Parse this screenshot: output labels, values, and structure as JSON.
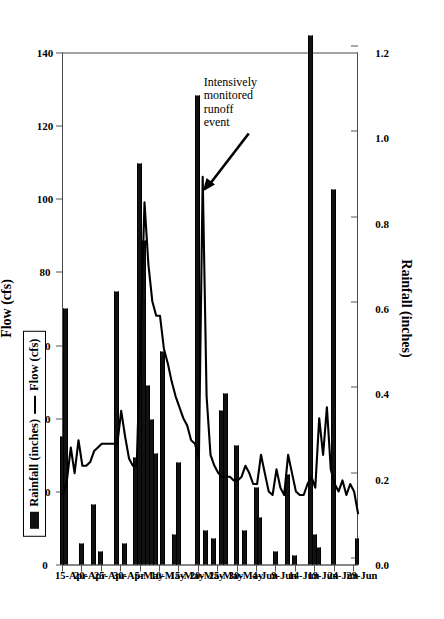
{
  "chart_data": {
    "type": "line",
    "title": "",
    "xlabel": "Date",
    "ylabel": "Rainfall (inches)",
    "y2label": "Flow (cfs)",
    "grid": false,
    "legend_position": "left-middle",
    "rain_axis": {
      "label": "Rainfall (inches)",
      "ticks": [
        "1.2",
        "1.0",
        "0.8",
        "0.6",
        "0.4",
        "0.2",
        "0.0"
      ],
      "tick_values": [
        1.2,
        1.0,
        0.8,
        0.6,
        0.4,
        0.2,
        0.0
      ],
      "lim": [
        0.0,
        1.2
      ],
      "direction": "reversed"
    },
    "flow_axis": {
      "label": "Flow (cfs)",
      "ticks": [
        "140",
        "120",
        "100",
        "80",
        "60",
        "40",
        "20",
        "0"
      ],
      "tick_values": [
        140,
        120,
        100,
        80,
        60,
        40,
        20,
        0
      ],
      "lim": [
        0,
        140
      ],
      "direction": "reversed"
    },
    "date_axis": {
      "label": "Date",
      "tick_labels": [
        "15-Apr",
        "20-Apr",
        "25-Apr",
        "30-Apr",
        "5-May",
        "10-May",
        "15-May",
        "20-May",
        "25-May",
        "30-May",
        "4-Jun",
        "9-Jun",
        "14-Jun",
        "19-Jun",
        "24-Jun",
        "29-Jun"
      ],
      "tick_day_index": [
        0,
        5,
        10,
        15,
        20,
        25,
        30,
        35,
        40,
        45,
        50,
        55,
        60,
        65,
        70,
        75
      ],
      "start_date": "15-Apr",
      "end_date": "30-Jun",
      "n_days": 77
    },
    "legend": [
      {
        "label": "Rainfall (inches)",
        "marker": "bar",
        "color": "#111111"
      },
      {
        "label": "Flow (cfs)",
        "marker": "line",
        "color": "#000000"
      }
    ],
    "annotations": [
      {
        "text_lines": [
          "Intensively",
          "monitored",
          "runoff",
          "event"
        ],
        "arrow": true,
        "points_to_day_index": 36
      }
    ],
    "series": [
      {
        "name": "Rainfall (inches)",
        "type": "bar",
        "units": "inches",
        "points": [
          {
            "day": 0,
            "value": 0.3
          },
          {
            "day": 1,
            "value": 0.6
          },
          {
            "day": 5,
            "value": 0.05
          },
          {
            "day": 8,
            "value": 0.14
          },
          {
            "day": 10,
            "value": 0.03
          },
          {
            "day": 14,
            "value": 0.64
          },
          {
            "day": 16,
            "value": 0.05
          },
          {
            "day": 19,
            "value": 0.25
          },
          {
            "day": 20,
            "value": 0.94
          },
          {
            "day": 21,
            "value": 0.76
          },
          {
            "day": 22,
            "value": 0.42
          },
          {
            "day": 23,
            "value": 0.34
          },
          {
            "day": 24,
            "value": 0.26
          },
          {
            "day": 26,
            "value": 0.5
          },
          {
            "day": 29,
            "value": 0.07
          },
          {
            "day": 30,
            "value": 0.24
          },
          {
            "day": 35,
            "value": 1.1
          },
          {
            "day": 37,
            "value": 0.08
          },
          {
            "day": 39,
            "value": 0.06
          },
          {
            "day": 41,
            "value": 0.36
          },
          {
            "day": 42,
            "value": 0.4
          },
          {
            "day": 45,
            "value": 0.28
          },
          {
            "day": 47,
            "value": 0.08
          },
          {
            "day": 50,
            "value": 0.18
          },
          {
            "day": 51,
            "value": 0.11
          },
          {
            "day": 55,
            "value": 0.03
          },
          {
            "day": 58,
            "value": 0.21
          },
          {
            "day": 60,
            "value": 0.02
          },
          {
            "day": 64,
            "value": 1.24
          },
          {
            "day": 65,
            "value": 0.07
          },
          {
            "day": 66,
            "value": 0.04
          },
          {
            "day": 70,
            "value": 0.88
          },
          {
            "day": 76,
            "value": 0.06
          }
        ]
      },
      {
        "name": "Flow (cfs)",
        "type": "line",
        "units": "cfs",
        "points": [
          {
            "day": 0,
            "value": 19
          },
          {
            "day": 1,
            "value": 23
          },
          {
            "day": 2,
            "value": 32
          },
          {
            "day": 3,
            "value": 25
          },
          {
            "day": 4,
            "value": 34
          },
          {
            "day": 5,
            "value": 27
          },
          {
            "day": 6,
            "value": 27
          },
          {
            "day": 7,
            "value": 28
          },
          {
            "day": 8,
            "value": 31
          },
          {
            "day": 9,
            "value": 32
          },
          {
            "day": 10,
            "value": 33
          },
          {
            "day": 11,
            "value": 33
          },
          {
            "day": 12,
            "value": 33
          },
          {
            "day": 13,
            "value": 33
          },
          {
            "day": 14,
            "value": 33
          },
          {
            "day": 15,
            "value": 42
          },
          {
            "day": 16,
            "value": 35
          },
          {
            "day": 17,
            "value": 29
          },
          {
            "day": 18,
            "value": 27
          },
          {
            "day": 19,
            "value": 27
          },
          {
            "day": 20,
            "value": 62
          },
          {
            "day": 21,
            "value": 99
          },
          {
            "day": 22,
            "value": 82
          },
          {
            "day": 23,
            "value": 72
          },
          {
            "day": 24,
            "value": 68
          },
          {
            "day": 25,
            "value": 68
          },
          {
            "day": 26,
            "value": 59
          },
          {
            "day": 27,
            "value": 55
          },
          {
            "day": 28,
            "value": 50
          },
          {
            "day": 29,
            "value": 46
          },
          {
            "day": 30,
            "value": 43
          },
          {
            "day": 31,
            "value": 40
          },
          {
            "day": 32,
            "value": 38
          },
          {
            "day": 33,
            "value": 34
          },
          {
            "day": 34,
            "value": 33
          },
          {
            "day": 35,
            "value": 29
          },
          {
            "day": 36,
            "value": 106
          },
          {
            "day": 37,
            "value": 46
          },
          {
            "day": 38,
            "value": 30
          },
          {
            "day": 39,
            "value": 27
          },
          {
            "day": 40,
            "value": 25
          },
          {
            "day": 41,
            "value": 24
          },
          {
            "day": 42,
            "value": 24
          },
          {
            "day": 43,
            "value": 24
          },
          {
            "day": 44,
            "value": 23
          },
          {
            "day": 45,
            "value": 23
          },
          {
            "day": 46,
            "value": 24
          },
          {
            "day": 47,
            "value": 27
          },
          {
            "day": 48,
            "value": 25
          },
          {
            "day": 49,
            "value": 22
          },
          {
            "day": 50,
            "value": 22
          },
          {
            "day": 51,
            "value": 30
          },
          {
            "day": 52,
            "value": 25
          },
          {
            "day": 53,
            "value": 20
          },
          {
            "day": 54,
            "value": 19
          },
          {
            "day": 55,
            "value": 26
          },
          {
            "day": 56,
            "value": 21
          },
          {
            "day": 57,
            "value": 19
          },
          {
            "day": 58,
            "value": 30
          },
          {
            "day": 59,
            "value": 25
          },
          {
            "day": 60,
            "value": 20
          },
          {
            "day": 61,
            "value": 19
          },
          {
            "day": 62,
            "value": 19
          },
          {
            "day": 63,
            "value": 22
          },
          {
            "day": 64,
            "value": 24
          },
          {
            "day": 65,
            "value": 21
          },
          {
            "day": 66,
            "value": 40
          },
          {
            "day": 67,
            "value": 30
          },
          {
            "day": 68,
            "value": 43
          },
          {
            "day": 69,
            "value": 26
          },
          {
            "day": 70,
            "value": 22
          },
          {
            "day": 71,
            "value": 20
          },
          {
            "day": 72,
            "value": 23
          },
          {
            "day": 73,
            "value": 19
          },
          {
            "day": 74,
            "value": 22
          },
          {
            "day": 75,
            "value": 20
          },
          {
            "day": 76,
            "value": 14
          }
        ]
      }
    ]
  }
}
